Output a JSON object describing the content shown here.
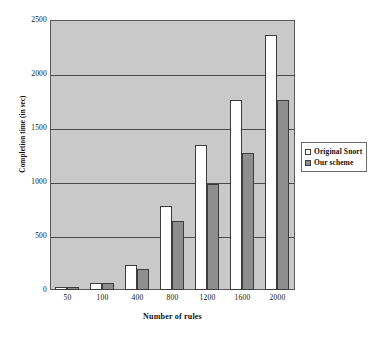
{
  "chart_data": {
    "type": "bar",
    "title": "",
    "xlabel": "Number of rules",
    "ylabel": "Completion time (in sec)",
    "categories": [
      "50",
      "100",
      "400",
      "800",
      "1200",
      "1600",
      "2000"
    ],
    "series": [
      {
        "name": "Original Snort",
        "color": "#ffffff",
        "values": [
          25,
          65,
          230,
          775,
          1340,
          1760,
          2365
        ]
      },
      {
        "name": "Our scheme",
        "color": "#8e8e8e",
        "values": [
          25,
          62,
          190,
          635,
          985,
          1270,
          1760
        ]
      }
    ],
    "ylim": [
      0,
      2500
    ],
    "yticks": [
      "0",
      "500",
      "1000",
      "1500",
      "2000",
      "2500"
    ],
    "grid": true,
    "legend_position": "right",
    "plot_background": "#c9c9c9"
  },
  "legend": {
    "items": [
      {
        "label": "Original Snort"
      },
      {
        "label": "Our scheme"
      }
    ]
  }
}
